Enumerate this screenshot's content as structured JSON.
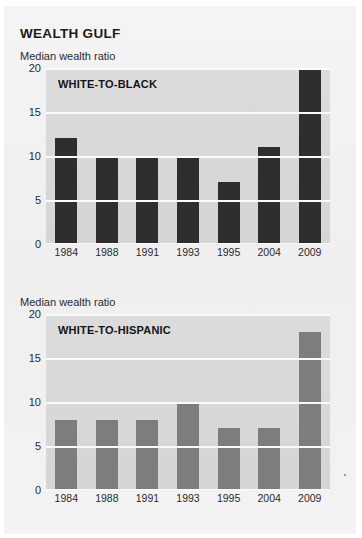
{
  "figure": {
    "title": "WEALTH GULF"
  },
  "panels": [
    {
      "axis_title": "Median wealth ratio",
      "series_label": "WHITE-TO-BLACK",
      "bar_color": "#2e2e2e"
    },
    {
      "axis_title": "Median wealth ratio",
      "series_label": "WHITE-TO-HISPANIC",
      "bar_color": "#7d7d7d"
    }
  ],
  "chart_data": [
    {
      "type": "bar",
      "title": "WEALTH GULF",
      "subtitle": "WHITE-TO-BLACK",
      "xlabel": "",
      "ylabel": "Median wealth ratio",
      "categories": [
        "1984",
        "1988",
        "1991",
        "1993",
        "1995",
        "2004",
        "2009"
      ],
      "values": [
        12,
        10,
        10,
        10,
        7,
        11,
        20
      ],
      "ylim": [
        0,
        20
      ],
      "yticks": [
        0,
        5,
        10,
        15,
        20
      ],
      "grid": true,
      "legend": "none",
      "bar_color": "#2e2e2e",
      "plot_background": "#d8d8d8"
    },
    {
      "type": "bar",
      "title": "WEALTH GULF",
      "subtitle": "WHITE-TO-HISPANIC",
      "xlabel": "",
      "ylabel": "Median wealth ratio",
      "categories": [
        "1984",
        "1988",
        "1991",
        "1993",
        "1995",
        "2004",
        "2009"
      ],
      "values": [
        8,
        8,
        8,
        10,
        7,
        7,
        18
      ],
      "ylim": [
        0,
        20
      ],
      "yticks": [
        0,
        5,
        10,
        15,
        20
      ],
      "grid": true,
      "legend": "none",
      "bar_color": "#7d7d7d",
      "plot_background": "#d8d8d8"
    }
  ]
}
